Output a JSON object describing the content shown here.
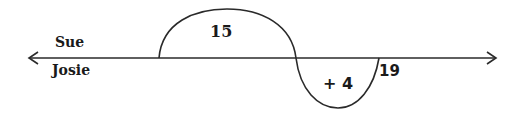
{
  "diagram": {
    "type": "number-line-jumps",
    "labels": {
      "top_left": "Sue",
      "bottom_left": "Josie"
    },
    "jumps": [
      {
        "label": "15",
        "direction": "above"
      },
      {
        "label": "+ 4",
        "direction": "below"
      }
    ],
    "endpoint_label": "19",
    "colors": {
      "stroke": "#2a2a2a",
      "text": "#1a1a1a"
    }
  }
}
